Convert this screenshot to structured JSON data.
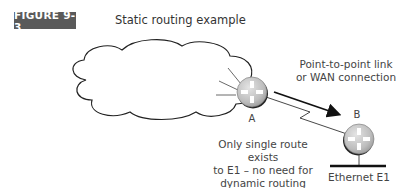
{
  "figure": {
    "label": "FIGURE 9-3",
    "title": "Static routing example"
  },
  "diagram": {
    "nodes": [
      {
        "id": "cloud",
        "type": "network-cloud"
      },
      {
        "id": "A",
        "type": "router",
        "label": "A"
      },
      {
        "id": "B",
        "type": "router",
        "label": "B"
      },
      {
        "id": "E1",
        "type": "ethernet-segment",
        "label": "Ethernet E1"
      }
    ],
    "edges": [
      {
        "from": "A",
        "to": "B",
        "type": "serial-link"
      },
      {
        "from": "B",
        "to": "E1",
        "type": "ethernet"
      }
    ],
    "annotations": {
      "link_line1": "Point-to-point link",
      "link_line2": "or WAN connection",
      "note_line1": "Only single route exists",
      "note_line2": "to E1 – no need for",
      "note_line3": "dynamic routing"
    },
    "colors": {
      "label_bg": "#5a5a5a",
      "router_fill": "#c8c8c8",
      "line": "#222222"
    }
  }
}
